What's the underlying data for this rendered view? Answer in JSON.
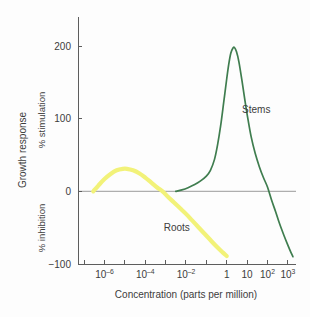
{
  "chart_data": {
    "type": "line",
    "title": "",
    "xlabel": "Concentration (parts per million)",
    "ylabel": "Growth response",
    "ylabel_upper": "% stimulation",
    "ylabel_lower": "% inhibition",
    "xscale": "log",
    "xlim": [
      -7.3,
      3.4
    ],
    "ylim": [
      -100,
      240
    ],
    "grid": false,
    "legend_position": "inline-annotation",
    "yticks": [
      200,
      100,
      0,
      -100
    ],
    "ytick_labels": [
      "200",
      "100",
      "0",
      "−100"
    ],
    "xticks_exponents": [
      -7,
      -6,
      -5,
      -4,
      -3,
      -2,
      -1,
      0,
      1,
      2,
      3
    ],
    "xtick_labels": [
      {
        "exp": -6,
        "base": "10",
        "sup": "–6"
      },
      {
        "exp": -4,
        "base": "10",
        "sup": "–4"
      },
      {
        "exp": -2,
        "base": "10",
        "sup": "–2"
      },
      {
        "exp": 0,
        "base": "1",
        "sup": ""
      },
      {
        "exp": 1,
        "base": "10",
        "sup": ""
      },
      {
        "exp": 2,
        "base": "10",
        "sup": "2"
      },
      {
        "exp": 3,
        "base": "10",
        "sup": "3"
      }
    ],
    "series": [
      {
        "name": "Roots",
        "color": "#f2f279",
        "label_x_exp": -2.45,
        "label_y": -55,
        "points": [
          [
            -6.55,
            0
          ],
          [
            -6.3,
            8
          ],
          [
            -6.0,
            17
          ],
          [
            -5.7,
            24
          ],
          [
            -5.4,
            29
          ],
          [
            -5.1,
            31
          ],
          [
            -4.9,
            31
          ],
          [
            -4.6,
            29
          ],
          [
            -4.3,
            25
          ],
          [
            -4.0,
            19
          ],
          [
            -3.7,
            12
          ],
          [
            -3.4,
            5
          ],
          [
            -3.15,
            0
          ],
          [
            -2.9,
            -7
          ],
          [
            -2.6,
            -15
          ],
          [
            -2.3,
            -23
          ],
          [
            -2.0,
            -31
          ],
          [
            -1.7,
            -40
          ],
          [
            -1.4,
            -49
          ],
          [
            -1.1,
            -58
          ],
          [
            -0.8,
            -67
          ],
          [
            -0.5,
            -76
          ],
          [
            -0.2,
            -84
          ],
          [
            0.0,
            -89
          ]
        ]
      },
      {
        "name": "Stems",
        "color": "#3f7d4f",
        "label_x_exp": 1.45,
        "label_y": 108,
        "points": [
          [
            -2.5,
            0
          ],
          [
            -2.2,
            2
          ],
          [
            -1.9,
            5
          ],
          [
            -1.6,
            9
          ],
          [
            -1.3,
            14
          ],
          [
            -1.0,
            21
          ],
          [
            -0.8,
            29
          ],
          [
            -0.6,
            44
          ],
          [
            -0.45,
            64
          ],
          [
            -0.3,
            90
          ],
          [
            -0.15,
            122
          ],
          [
            0.0,
            155
          ],
          [
            0.1,
            175
          ],
          [
            0.2,
            190
          ],
          [
            0.3,
            197
          ],
          [
            0.38,
            198
          ],
          [
            0.48,
            192
          ],
          [
            0.6,
            178
          ],
          [
            0.75,
            152
          ],
          [
            0.9,
            124
          ],
          [
            1.05,
            98
          ],
          [
            1.2,
            75
          ],
          [
            1.4,
            52
          ],
          [
            1.6,
            34
          ],
          [
            1.8,
            19
          ],
          [
            2.0,
            6
          ],
          [
            2.2,
            -12
          ],
          [
            2.4,
            -28
          ],
          [
            2.6,
            -45
          ],
          [
            2.8,
            -60
          ],
          [
            3.0,
            -74
          ],
          [
            3.15,
            -84
          ],
          [
            3.25,
            -90
          ]
        ],
        "peak": {
          "x_exp": 0.4,
          "y": 198
        }
      }
    ],
    "annotations": [
      {
        "text": "Stems",
        "series": "Stems"
      },
      {
        "text": "Roots",
        "series": "Roots"
      }
    ]
  },
  "axis": {
    "y_title": "Growth response",
    "y_upper_title": "% stimulation",
    "y_lower_title": "% inhibition",
    "x_title": "Concentration (parts per million)"
  },
  "colors": {
    "roots": "#f2f279",
    "stems": "#3f7d4f",
    "axis": "#5d5d5d",
    "zero_line": "#aeaeae",
    "text": "#3c3c3c",
    "background": "#fdfdfd"
  }
}
